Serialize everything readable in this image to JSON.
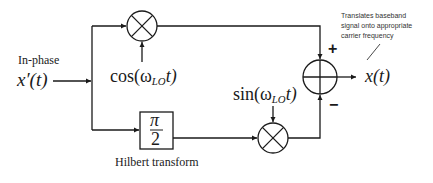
{
  "diagram": {
    "type": "block-diagram",
    "input": {
      "label_top": "In-phase",
      "signal": "x′(t)"
    },
    "top_mixer": {
      "symbol": "multiplier",
      "lo_label": "cos(ω",
      "lo_sub": "LO",
      "lo_tail": "t)"
    },
    "hilbert": {
      "numerator": "π",
      "denominator": "2",
      "caption": "Hilbert transform"
    },
    "bottom_mixer": {
      "symbol": "multiplier",
      "lo_label": "sin(ω",
      "lo_sub": "LO",
      "lo_tail": "t)"
    },
    "summer": {
      "symbol": "adder",
      "plus_sign": "+",
      "minus_sign": "−"
    },
    "output": {
      "signal": "x(t)"
    },
    "annotation": {
      "line1": "Translates baseband",
      "line2": "signal onto appropriate",
      "line3": "carrier frequency"
    },
    "colors": {
      "line": "#1a1a1a",
      "background": "#ffffff"
    }
  }
}
